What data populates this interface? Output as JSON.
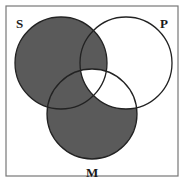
{
  "diagram": {
    "type": "venn-3",
    "frame": {
      "x": 6,
      "y": 6,
      "width": 172,
      "height": 170,
      "stroke": "#777777"
    },
    "colors": {
      "shaded": "#5a5a5a",
      "unshaded": "#ffffff",
      "outline": "#222222"
    },
    "sets": [
      {
        "id": "S",
        "label": "S",
        "cx": 61,
        "cy": 63,
        "r": 46,
        "label_x": 21,
        "label_y": 27
      },
      {
        "id": "P",
        "label": "P",
        "cx": 126,
        "cy": 63,
        "r": 46,
        "label_x": 161,
        "label_y": 27
      },
      {
        "id": "M",
        "label": "M",
        "cx": 92,
        "cy": 114,
        "r": 45,
        "label_x": 86,
        "label_y": 176
      }
    ],
    "regions": [
      {
        "region": "S only",
        "shaded": true
      },
      {
        "region": "P only",
        "shaded": false
      },
      {
        "region": "M only",
        "shaded": true
      },
      {
        "region": "S and P not M",
        "shaded": true
      },
      {
        "region": "S and M not P",
        "shaded": true
      },
      {
        "region": "P and M not S",
        "shaded": false
      },
      {
        "region": "S and P and M",
        "shaded": false
      }
    ]
  }
}
